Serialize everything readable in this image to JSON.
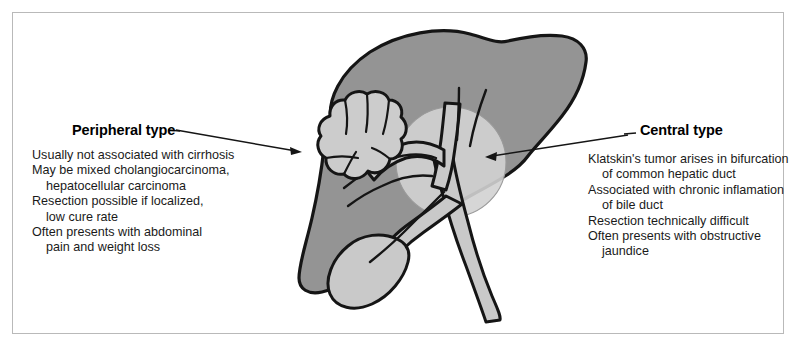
{
  "figure": {
    "background_color": "#ffffff",
    "frame_color": "#b9b9b9"
  },
  "colors": {
    "liver_fill": "#949494",
    "duct_fill": "#c9c9c9",
    "tumor_fill": "#cccccc",
    "highlight_circle": "#d2d2d2",
    "outline": "#151515",
    "text": "#1a1a1a"
  },
  "peripheral": {
    "title": "Peripheral type",
    "lines": [
      {
        "text": "Usually not associated with cirrhosis",
        "indent": false
      },
      {
        "text": "May be mixed cholangiocarcinoma,",
        "indent": false
      },
      {
        "text": "hepatocellular carcinoma",
        "indent": true
      },
      {
        "text": "Resection possible if localized,",
        "indent": false
      },
      {
        "text": "low cure rate",
        "indent": true
      },
      {
        "text": "Often presents with abdominal",
        "indent": false
      },
      {
        "text": "pain and weight loss",
        "indent": true
      }
    ]
  },
  "central": {
    "title": "Central type",
    "lines": [
      {
        "text": "Klatskin's tumor arises in bifurcation",
        "indent": false
      },
      {
        "text": "of common hepatic duct",
        "indent": true
      },
      {
        "text": "Associated with chronic inflamation",
        "indent": false
      },
      {
        "text": "of bile duct",
        "indent": true
      },
      {
        "text": "Resection technically difficult",
        "indent": false
      },
      {
        "text": "Often presents with obstructive",
        "indent": false
      },
      {
        "text": "jaundice",
        "indent": true
      }
    ]
  },
  "anatomy": {
    "liver_label": "liver",
    "gallbladder_label": "gallbladder",
    "bile_duct_label": "common bile duct",
    "hepatic_duct_label": "common hepatic duct",
    "peripheral_tumor_label": "peripheral cholangiocarcinoma mass",
    "central_highlight_label": "hilar bifurcation highlight"
  }
}
